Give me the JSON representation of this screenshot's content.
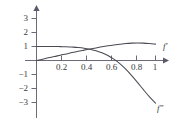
{
  "chart_data": {
    "type": "line",
    "title": "",
    "subtitle": "",
    "xlabel": "",
    "ylabel": "",
    "xlim": [
      0,
      1.08
    ],
    "ylim": [
      -3.4,
      3.4
    ],
    "grid": false,
    "legend_position": "inline-right",
    "axis_color": "#5a5a6a",
    "curve_color": "#4a4a52",
    "label_color": "#3a3a3a",
    "background_color": "#ffffff",
    "x_ticks": [
      {
        "value": 0.2,
        "label": "0.2"
      },
      {
        "value": 0.4,
        "label": "0.4"
      },
      {
        "value": 0.6,
        "label": "0.6"
      },
      {
        "value": 0.8,
        "label": "0.8"
      },
      {
        "value": 1.0,
        "label": "1"
      }
    ],
    "y_ticks": [
      {
        "value": 3,
        "label": "3"
      },
      {
        "value": 2,
        "label": "2"
      },
      {
        "value": 1,
        "label": "1"
      },
      {
        "value": -1,
        "label": "−1"
      },
      {
        "value": -2,
        "label": "−2"
      },
      {
        "value": -3,
        "label": "−3"
      }
    ],
    "series": [
      {
        "name": "f-prime",
        "label_base": "f",
        "label_prime": "′",
        "label_text": "f′",
        "x": [
          0.0,
          0.05,
          0.1,
          0.15,
          0.2,
          0.25,
          0.3,
          0.35,
          0.4,
          0.45,
          0.5,
          0.55,
          0.6,
          0.65,
          0.7,
          0.75,
          0.8,
          0.85,
          0.9,
          0.95,
          1.0
        ],
        "values": [
          0.0,
          0.09,
          0.19,
          0.28,
          0.38,
          0.47,
          0.57,
          0.66,
          0.74,
          0.82,
          0.9,
          0.98,
          1.05,
          1.11,
          1.16,
          1.21,
          1.24,
          1.25,
          1.24,
          1.21,
          1.17
        ]
      },
      {
        "name": "f-double-prime",
        "label_base": "f",
        "label_prime": "″",
        "label_text": "f″",
        "x": [
          0.0,
          0.05,
          0.1,
          0.15,
          0.2,
          0.25,
          0.3,
          0.35,
          0.4,
          0.45,
          0.5,
          0.55,
          0.6,
          0.65,
          0.7,
          0.75,
          0.8,
          0.85,
          0.9,
          0.95,
          1.0
        ],
        "values": [
          1.0,
          1.0,
          1.0,
          1.0,
          0.99,
          0.98,
          0.96,
          0.93,
          0.88,
          0.8,
          0.7,
          0.55,
          0.36,
          0.1,
          -0.22,
          -0.62,
          -1.08,
          -1.58,
          -2.1,
          -2.6,
          -3.05
        ]
      }
    ],
    "intersections": [
      {
        "x": 0.43,
        "y": 0.84
      }
    ],
    "zero_crossings": [
      {
        "series": "f-double-prime",
        "x": 0.67
      }
    ],
    "maxima": [
      {
        "series": "f-prime",
        "x": 0.83,
        "y": 1.25
      }
    ],
    "curve_labels": [
      {
        "name": "f-prime-label",
        "text": "f′",
        "base": "f",
        "prime": "′"
      },
      {
        "name": "f-double-prime-label",
        "text": "f″",
        "base": "f",
        "prime": "″"
      }
    ]
  }
}
